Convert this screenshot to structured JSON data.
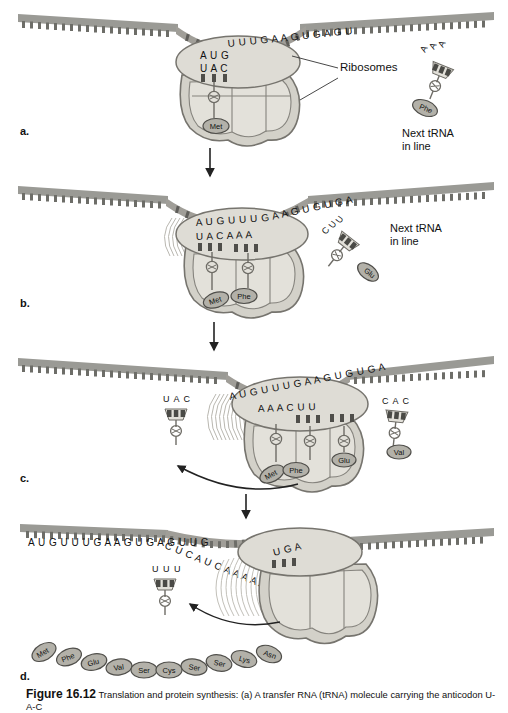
{
  "figure": {
    "number": "Figure 16.12",
    "caption": "Translation and protein synthesis: (a) A transfer RNA (tRNA) molecule carrying the anticodon U-A-C"
  },
  "colors": {
    "mrna_band": "#9a9a95",
    "mrna_band_dark": "#7d7d78",
    "ribosome_fill": "#d9d7cf",
    "ribosome_fill_light": "#e6e4dd",
    "ribosome_stroke": "#7a7872",
    "aa_fill": "#b5b3ab",
    "aa_stroke": "#555550",
    "trna_fill": "#cfcdc6",
    "text": "#111111",
    "arrow": "#222222"
  },
  "panels": [
    {
      "id": "a",
      "letter": "a.",
      "mrna_sequence": "AUGUUUGAAGUGAGU",
      "ribosome_codons": "AUG",
      "anticodons": "UAC",
      "amino_acids": [
        "Met"
      ],
      "labels": {
        "ribosomes": "Ribosomes"
      },
      "next_trna": {
        "anticodon": "AAA",
        "amino_acid": "Phe",
        "note_line1": "Next tRNA",
        "note_line2": "in line"
      }
    },
    {
      "id": "b",
      "letter": "b.",
      "mrna_sequence": "AUGUUUGAAGUGUGA",
      "ribosome_codons": "AUGUUU",
      "anticodons": "UAC AAA",
      "amino_acids": [
        "Met",
        "Phe"
      ],
      "next_trna": {
        "anticodon": "CUU",
        "amino_acid": "Glu",
        "note_line1": "Next tRNA",
        "note_line2": "in line"
      }
    },
    {
      "id": "c",
      "letter": "c.",
      "mrna_sequence": "AUGUUUGAAGUGUGA",
      "ribosome_codons": "AUGUUUGAAGUGUGA",
      "anticodons": "AAA CUU",
      "amino_acids": [
        "Met",
        "Phe",
        "Glu"
      ],
      "released_trna": {
        "anticodon": "UAC"
      },
      "next_trna": {
        "anticodon": "CAC",
        "amino_acid": "Val"
      }
    },
    {
      "id": "d",
      "letter": "d.",
      "mrna_sequence": "AUGUUUGAAGUGAGUUGCUCAUCAAAAA",
      "stop_codon": "UGA",
      "released_trna": {
        "anticodon": "UUU"
      },
      "polypeptide": [
        "Met",
        "Phe",
        "Glu",
        "Val",
        "Ser",
        "Cys",
        "Ser",
        "Ser",
        "Lys",
        "Asn"
      ]
    }
  ]
}
